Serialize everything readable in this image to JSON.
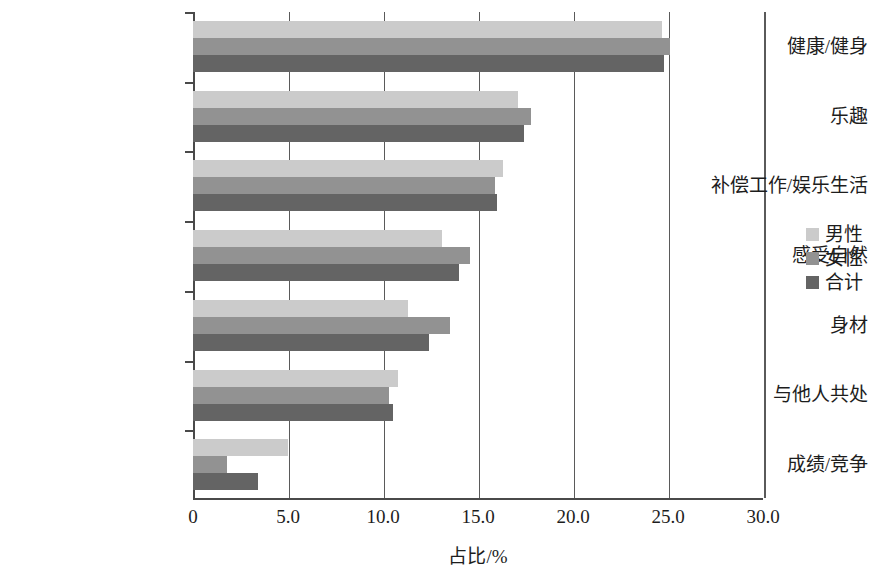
{
  "chart_data": {
    "type": "bar",
    "orientation": "horizontal",
    "title": "",
    "xlabel": "占比/%",
    "ylabel": "",
    "categories": [
      "健康/健身",
      "乐趣",
      "补偿工作/娱乐生活",
      "感受自然",
      "身材",
      "与他人共处",
      "成绩/竞争"
    ],
    "series": [
      {
        "name": "男性",
        "color": "#cbcbcb",
        "values": [
          24.7,
          17.1,
          16.3,
          13.1,
          11.3,
          10.8,
          5.0
        ]
      },
      {
        "name": "女性",
        "color": "#929292",
        "values": [
          25.1,
          17.8,
          15.9,
          14.6,
          13.5,
          10.3,
          1.8
        ]
      },
      {
        "name": "合计",
        "color": "#646464",
        "values": [
          24.8,
          17.4,
          16.0,
          14.0,
          12.4,
          10.5,
          3.4
        ]
      }
    ],
    "xlim": [
      0,
      30
    ],
    "xticks": [
      0,
      5,
      10,
      15,
      20,
      25,
      30
    ],
    "xtick_labels": [
      "0",
      "5.0",
      "10.0",
      "15.0",
      "20.0",
      "25.0",
      "30.0"
    ],
    "grid": true,
    "grid_axis": "x",
    "legend_position": "right"
  },
  "legend": {
    "entries": [
      {
        "label": "男性",
        "color": "#cbcbcb"
      },
      {
        "label": "女性",
        "color": "#929292"
      },
      {
        "label": "合计",
        "color": "#646464"
      }
    ]
  }
}
